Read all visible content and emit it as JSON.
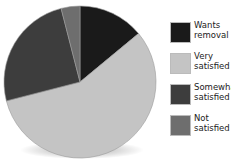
{
  "chart_data": {
    "type": "pie",
    "title": "",
    "categories": [
      "Wants removal",
      "Very satisfied",
      "Somewhat satisfied",
      "Not satisfied"
    ],
    "values": [
      14,
      57,
      25,
      4
    ],
    "colors": [
      "#1a1a1a",
      "#c4c4c4",
      "#3d3d3d",
      "#6e6e6e"
    ],
    "start_angle_deg": 0,
    "direction": "clockwise",
    "legend_position": "right"
  },
  "legend": {
    "items": [
      {
        "label": "Wants\nremoval",
        "color": "#1a1a1a"
      },
      {
        "label": "Very\nsatisfied",
        "color": "#c4c4c4"
      },
      {
        "label": "Somewhat\nsatisfied",
        "color": "#3d3d3d"
      },
      {
        "label": "Not\nsatisfied",
        "color": "#6e6e6e"
      }
    ]
  }
}
